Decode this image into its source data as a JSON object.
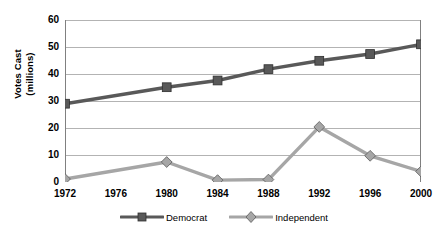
{
  "chart_data": {
    "type": "line",
    "title": "",
    "xlabel": "",
    "ylabel": "Votes Cast (millions)",
    "ylabel_line1": "Votes Cast",
    "ylabel_line2": "(millions)",
    "categories": [
      "1972",
      "1976",
      "1980",
      "1984",
      "1988",
      "1992",
      "1996",
      "2000"
    ],
    "x_tick_labels": [
      "1972",
      "1976",
      "1980",
      "1984",
      "1988",
      "1992",
      "1996",
      "2000"
    ],
    "y_tick_labels": [
      "0",
      "10",
      "20",
      "30",
      "40",
      "50",
      "60"
    ],
    "y_ticks": [
      0,
      10,
      20,
      30,
      40,
      50,
      60
    ],
    "ylim": [
      0,
      60
    ],
    "grid": "horizontal",
    "legend_position": "bottom",
    "series": [
      {
        "name": "Democrat",
        "color": "#595959",
        "marker": "square",
        "values": [
          29.0,
          null,
          35.1,
          37.6,
          41.8,
          44.9,
          47.4,
          51.0
        ],
        "markers_at": [
          "1972",
          "1980",
          "1984",
          "1988",
          "1992",
          "1996",
          "2000"
        ]
      },
      {
        "name": "Independent",
        "color": "#a6a6a6",
        "marker": "diamond",
        "values": [
          1.1,
          null,
          7.4,
          0.7,
          0.9,
          20.4,
          9.7,
          3.9
        ],
        "markers_at": [
          "1972",
          "1980",
          "1984",
          "1988",
          "1992",
          "1996",
          "2000"
        ]
      }
    ]
  },
  "legend": {
    "entries": [
      {
        "label": "Democrat",
        "color": "#595959",
        "marker": "square"
      },
      {
        "label": "Independent",
        "color": "#a6a6a6",
        "marker": "diamond"
      }
    ]
  },
  "colors": {
    "democrat": "#595959",
    "independent": "#a6a6a6",
    "axis": "#808080",
    "grid": "#b3b3b3",
    "text": "#000000",
    "background": "#ffffff"
  }
}
